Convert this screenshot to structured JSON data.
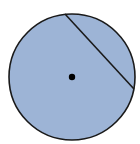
{
  "diagram": {
    "type": "circle-with-chord",
    "circle": {
      "cx": 72,
      "cy": 77,
      "r": 63,
      "fill": "#9db4d6",
      "stroke": "#1a1a1a"
    },
    "chord": {
      "x1": 65,
      "y1": 14,
      "x2": 134,
      "y2": 89,
      "stroke": "#1a1a1a"
    },
    "center_point": {
      "cx": 72,
      "cy": 77,
      "r": 3.2,
      "fill": "#000000"
    }
  }
}
